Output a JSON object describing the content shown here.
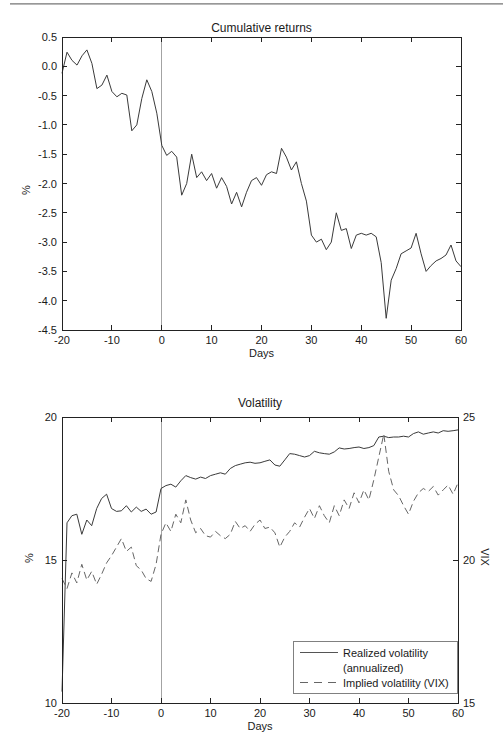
{
  "chart_data": [
    {
      "type": "line",
      "title": "Cumulative returns",
      "xlabel": "Days",
      "ylabel": "%",
      "xlim": [
        -20,
        60
      ],
      "ylim": [
        -4.5,
        0.5
      ],
      "grid": false,
      "event_line_x": 0,
      "xticks": [
        -20,
        -10,
        0,
        10,
        20,
        30,
        40,
        50,
        60
      ],
      "xtick_labels": [
        "-20",
        "-10",
        "0",
        "10",
        "20",
        "30",
        "40",
        "50",
        "60"
      ],
      "yticks": [
        0.5,
        0.0,
        -0.5,
        -1.0,
        -1.5,
        -2.0,
        -2.5,
        -3.0,
        -3.5,
        -4.0,
        -4.5
      ],
      "ytick_labels": [
        "0.5",
        "0.0",
        "-0.5",
        "-1.0",
        "-1.5",
        "-2.0",
        "-2.5",
        "-3.0",
        "-3.5",
        "-4.0",
        "-4.5"
      ],
      "x": [
        -20,
        -19,
        -18,
        -17,
        -16,
        -15,
        -14,
        -13,
        -12,
        -11,
        -10,
        -9,
        -8,
        -7,
        -6,
        -5,
        -4,
        -3,
        -2,
        -1,
        0,
        1,
        2,
        3,
        4,
        5,
        6,
        7,
        8,
        9,
        10,
        11,
        12,
        13,
        14,
        15,
        16,
        17,
        18,
        19,
        20,
        21,
        22,
        23,
        24,
        25,
        26,
        27,
        28,
        29,
        30,
        31,
        32,
        33,
        34,
        35,
        36,
        37,
        38,
        39,
        40,
        41,
        42,
        43,
        44,
        45,
        46,
        47,
        48,
        49,
        50,
        51,
        52,
        53,
        54,
        55,
        56,
        57,
        58,
        59,
        60
      ],
      "series": [
        {
          "name": "Cumulative returns",
          "style": "solid",
          "axis": "left",
          "values": [
            -0.12,
            0.24,
            0.1,
            0.02,
            0.18,
            0.28,
            0.05,
            -0.38,
            -0.32,
            -0.15,
            -0.43,
            -0.52,
            -0.46,
            -0.49,
            -1.1,
            -1.0,
            -0.55,
            -0.23,
            -0.43,
            -0.8,
            -1.35,
            -1.52,
            -1.45,
            -1.55,
            -2.2,
            -2.0,
            -1.5,
            -1.9,
            -1.8,
            -1.95,
            -1.83,
            -2.08,
            -1.9,
            -2.05,
            -2.35,
            -2.15,
            -2.4,
            -2.15,
            -1.95,
            -1.9,
            -2.03,
            -1.85,
            -1.8,
            -1.83,
            -1.4,
            -1.55,
            -1.77,
            -1.63,
            -2.0,
            -2.3,
            -2.88,
            -3.0,
            -2.95,
            -3.13,
            -3.0,
            -2.5,
            -2.8,
            -2.77,
            -3.11,
            -2.88,
            -2.85,
            -2.88,
            -2.85,
            -2.91,
            -3.35,
            -4.3,
            -3.65,
            -3.45,
            -3.2,
            -3.15,
            -3.1,
            -2.85,
            -3.2,
            -3.5,
            -3.4,
            -3.32,
            -3.28,
            -3.22,
            -3.05,
            -3.32,
            -3.42
          ]
        }
      ]
    },
    {
      "type": "line",
      "title": "Volatility",
      "xlabel": "Days",
      "ylabel_left": "%",
      "ylabel_right": "VIX",
      "xlim": [
        -20,
        60
      ],
      "ylim_left": [
        10,
        20
      ],
      "ylim_right": [
        15,
        25
      ],
      "grid": false,
      "event_line_x": 0,
      "xticks": [
        -20,
        -10,
        0,
        10,
        20,
        30,
        40,
        50,
        60
      ],
      "xtick_labels": [
        "-20",
        "-10",
        "0",
        "10",
        "20",
        "30",
        "40",
        "50",
        "60"
      ],
      "yticks_left": [
        20,
        15,
        10
      ],
      "ytick_labels_left": [
        "20",
        "15",
        "10"
      ],
      "yticks_right": [
        25,
        20,
        15
      ],
      "ytick_labels_right": [
        "25",
        "20",
        "15"
      ],
      "x": [
        -20,
        -19,
        -18,
        -17,
        -16,
        -15,
        -14,
        -13,
        -12,
        -11,
        -10,
        -9,
        -8,
        -7,
        -6,
        -5,
        -4,
        -3,
        -2,
        -1,
        0,
        1,
        2,
        3,
        4,
        5,
        6,
        7,
        8,
        9,
        10,
        11,
        12,
        13,
        14,
        15,
        16,
        17,
        18,
        19,
        20,
        21,
        22,
        23,
        24,
        25,
        26,
        27,
        28,
        29,
        30,
        31,
        32,
        33,
        34,
        35,
        36,
        37,
        38,
        39,
        40,
        41,
        42,
        43,
        44,
        45,
        46,
        47,
        48,
        49,
        50,
        51,
        52,
        53,
        54,
        55,
        56,
        57,
        58,
        59,
        60
      ],
      "series": [
        {
          "name": "Realized volatility (annualized)",
          "style": "solid",
          "axis": "left",
          "values": [
            10.4,
            16.3,
            16.55,
            16.6,
            15.9,
            16.4,
            16.2,
            16.8,
            17.15,
            17.3,
            16.8,
            16.7,
            16.72,
            16.9,
            16.68,
            16.85,
            16.7,
            16.78,
            16.6,
            16.68,
            17.5,
            17.6,
            17.65,
            17.55,
            17.77,
            17.95,
            17.88,
            17.83,
            17.9,
            17.85,
            17.95,
            18.0,
            18.05,
            18.0,
            18.2,
            18.3,
            18.35,
            18.4,
            18.42,
            18.38,
            18.4,
            18.45,
            18.5,
            18.32,
            18.28,
            18.5,
            18.72,
            18.7,
            18.65,
            18.6,
            18.65,
            18.8,
            18.75,
            18.72,
            18.7,
            18.78,
            18.92,
            18.88,
            18.9,
            18.93,
            18.95,
            18.9,
            18.93,
            19.0,
            19.3,
            19.33,
            19.28,
            19.3,
            19.3,
            19.33,
            19.3,
            19.42,
            19.48,
            19.4,
            19.44,
            19.48,
            19.44,
            19.52,
            19.5,
            19.52,
            19.55
          ]
        },
        {
          "name": "Implied volatility (VIX)",
          "style": "dashed",
          "axis": "right",
          "values": [
            19.35,
            19.0,
            19.55,
            19.2,
            19.85,
            19.3,
            19.6,
            19.15,
            19.5,
            19.9,
            20.15,
            20.45,
            20.75,
            20.3,
            20.45,
            19.8,
            19.65,
            19.35,
            19.25,
            19.85,
            20.9,
            21.3,
            21.0,
            21.6,
            21.3,
            22.1,
            21.4,
            20.95,
            21.1,
            20.85,
            20.8,
            21.0,
            20.85,
            20.75,
            20.9,
            21.35,
            21.1,
            21.2,
            21.0,
            21.25,
            21.4,
            21.1,
            21.15,
            20.95,
            20.45,
            20.8,
            21.0,
            21.3,
            21.15,
            21.5,
            21.8,
            21.45,
            21.9,
            21.55,
            21.3,
            21.9,
            21.55,
            22.1,
            21.8,
            22.35,
            22.0,
            22.45,
            22.1,
            22.8,
            23.6,
            24.4,
            23.1,
            22.45,
            22.25,
            21.9,
            21.6,
            22.05,
            22.35,
            22.5,
            22.4,
            22.57,
            22.27,
            22.45,
            22.62,
            22.3,
            22.7
          ]
        }
      ],
      "legend": {
        "position": "bottom-right",
        "items": [
          {
            "line1": "Realized volatility",
            "line2": "(annualized)",
            "style": "solid"
          },
          {
            "line1": "Implied volatility (VIX)",
            "style": "dashed"
          }
        ]
      }
    }
  ]
}
